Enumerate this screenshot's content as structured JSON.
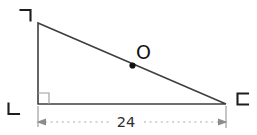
{
  "diagram": {
    "background_color": "#ffffff",
    "triangle_line_color": "#3f3f3f",
    "label_color": "#1e1e1e",
    "dimension_line_color": "#ababab",
    "dimension_arrow_color": "#8c8c8c",
    "vertex_labels": {
      "top_left": "ㄱ",
      "bottom_left": "ㄴ",
      "bottom_right": "ㄷ"
    },
    "right_angle_at": "ㄴ",
    "point_label": "O",
    "dimension_value": "24"
  }
}
